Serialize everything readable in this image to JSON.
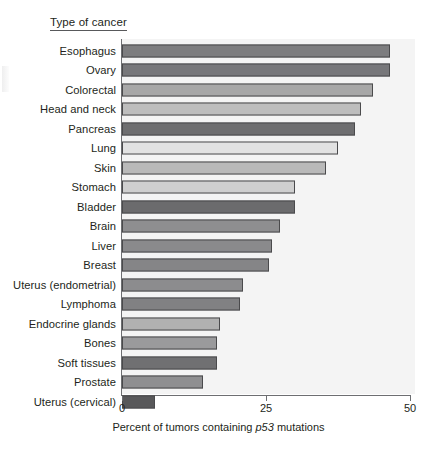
{
  "figure": {
    "category_axis_title": "Type of cancer",
    "x_axis_caption_before": "Percent of tumors containing ",
    "x_axis_caption_italic": "p53",
    "x_axis_caption_after": " mutations"
  },
  "chart_data": {
    "type": "bar",
    "orientation": "horizontal",
    "title": "",
    "xlabel": "Percent of tumors containing p53 mutations",
    "ylabel": "Type of cancer",
    "xlim": [
      0,
      50
    ],
    "xticks": [
      "0",
      "25",
      "50"
    ],
    "xtick_values": [
      0,
      25,
      50
    ],
    "grid": false,
    "legend": "none",
    "categories": [
      "Esophagus",
      "Ovary",
      "Colorectal",
      "Head and neck",
      "Pancreas",
      "Lung",
      "Skin",
      "Stomach",
      "Bladder",
      "Brain",
      "Liver",
      "Breast",
      "Uterus (endometrial)",
      "Lymphoma",
      "Endocrine glands",
      "Bones",
      "Soft tissues",
      "Prostate",
      "Uterus (cervical)"
    ],
    "values": [
      46.5,
      46.5,
      43.5,
      41.5,
      40.5,
      37.5,
      35.5,
      30,
      30,
      27.5,
      26,
      25.5,
      21,
      20.5,
      17,
      16.5,
      16.5,
      14,
      5.7
    ],
    "bar_colors": [
      "#7d7d7f",
      "#77777a",
      "#a7a7a7",
      "#bdbdbd",
      "#6e6e70",
      "#e2e2e2",
      "#b9b9b9",
      "#cfcfcf",
      "#6b6b6d",
      "#8e8e90",
      "#8a8a8c",
      "#858587",
      "#8c8c8e",
      "#818183",
      "#b1b1b1",
      "#9a9a9c",
      "#707072",
      "#8f8f91",
      "#58585a"
    ]
  }
}
